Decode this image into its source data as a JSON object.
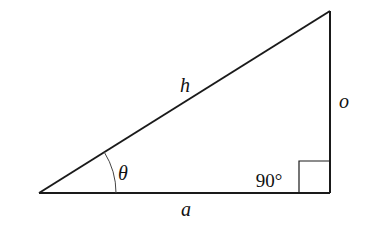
{
  "diagram": {
    "labels": {
      "hypotenuse": "h",
      "opposite": "o",
      "adjacent": "a",
      "angle": "θ",
      "right_angle": "90°"
    },
    "vertices": {
      "left": [
        39,
        193
      ],
      "right_bottom": [
        330,
        193
      ],
      "top": [
        330,
        11
      ]
    },
    "colors": {
      "stroke": "#1a1a1a",
      "arc": "#444444",
      "background": "#ffffff"
    }
  }
}
